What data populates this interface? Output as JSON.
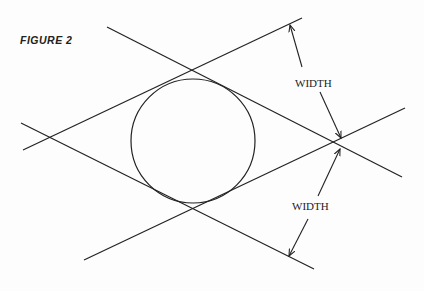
{
  "figure": {
    "label": "FIGURE 2",
    "dimension_labels": [
      "WIDTH",
      "WIDTH"
    ],
    "colors": {
      "stroke": "#222222",
      "background": "#fdfdfd"
    },
    "circle": {
      "cx": 193,
      "cy": 141,
      "r": 62
    },
    "lines": [
      {
        "x1": 107,
        "y1": 27,
        "x2": 402,
        "y2": 177
      },
      {
        "x1": 23,
        "y1": 150,
        "x2": 302,
        "y2": 18
      },
      {
        "x1": 21,
        "y1": 123,
        "x2": 314,
        "y2": 269
      },
      {
        "x1": 84,
        "y1": 260,
        "x2": 405,
        "y2": 108
      }
    ]
  }
}
